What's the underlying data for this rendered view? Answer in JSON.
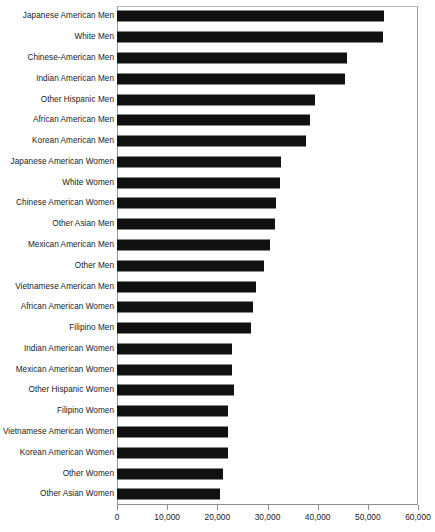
{
  "chart_data": {
    "type": "bar",
    "orientation": "horizontal",
    "title": "",
    "subtitle": "",
    "xlabel": "",
    "ylabel": "",
    "xlim": [
      0,
      60000
    ],
    "xticks": [
      0,
      10000,
      20000,
      30000,
      40000,
      50000,
      60000
    ],
    "xtick_labels": [
      "0",
      "10,000",
      "20,000",
      "30,000",
      "40,000",
      "50,000",
      "60,000"
    ],
    "grid": false,
    "legend": null,
    "bar_color": "#111111",
    "categories": [
      "Japanese American Men",
      "White Men",
      "Chinese-American Men",
      "Indian American Men",
      "Other Hispanic Men",
      "African American Men",
      "Korean American Men",
      "Japanese American Women",
      "White Women",
      "Chinese American Women",
      "Other Asian Men",
      "Mexican American Men",
      "Other Men",
      "Vietnamese American Men",
      "African American Women",
      "Filipino Men",
      "Indian American Women",
      "Mexican American Women",
      "Other Hispanic Women",
      "Filipino Women",
      "Vietnamese American Women",
      "Korean American Women",
      "Other Women",
      "Other Asian Women"
    ],
    "values": [
      53200,
      53000,
      45800,
      45400,
      39400,
      38400,
      37600,
      32600,
      32400,
      31600,
      31400,
      30400,
      29400,
      27800,
      27200,
      26800,
      23000,
      23000,
      23400,
      22200,
      22200,
      22200,
      21200,
      20600
    ]
  }
}
